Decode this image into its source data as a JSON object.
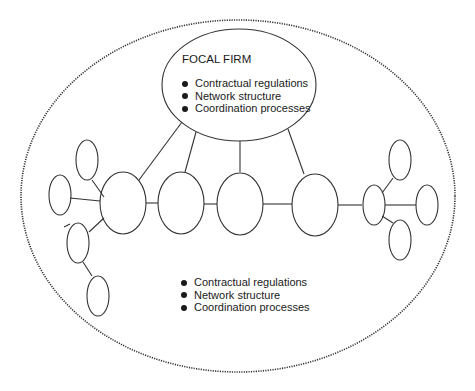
{
  "focal_firm": {
    "title": "FOCAL FIRM",
    "items": [
      "Contractual regulations",
      "Network structure",
      "Coordination processes"
    ]
  },
  "network": {
    "items": [
      "Contractual regulations",
      "Network structure",
      "Coordination processes"
    ]
  },
  "colors": {
    "stroke": "#333333",
    "text": "#1a1a1a",
    "background": "#ffffff"
  }
}
